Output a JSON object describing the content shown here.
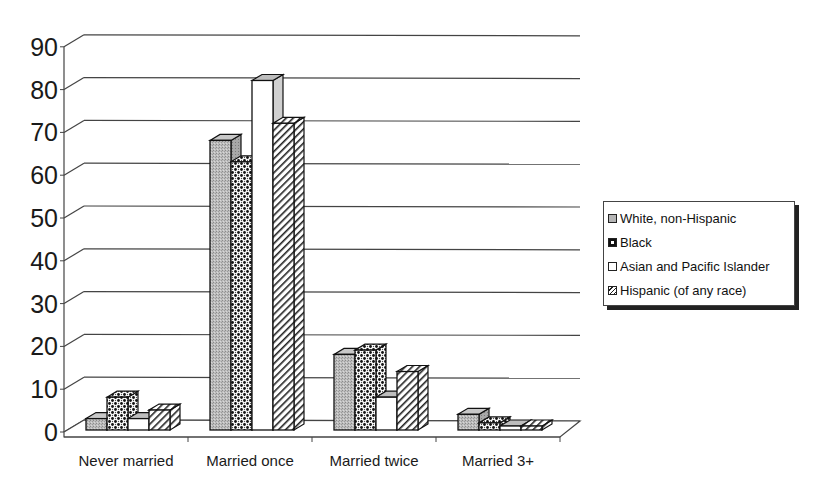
{
  "chart_data": {
    "type": "bar",
    "variant": "3d-clustered-column",
    "title": "",
    "xlabel": "",
    "ylabel": "",
    "categories": [
      "Never married",
      "Married once",
      "Married twice",
      "Married 3+"
    ],
    "series": [
      {
        "name": "White, non-Hispanic",
        "pattern": "gray-stipple",
        "values": [
          5,
          70,
          20,
          6
        ]
      },
      {
        "name": "Black",
        "pattern": "black-dots-checker",
        "values": [
          10,
          65,
          21,
          4
        ]
      },
      {
        "name": "Asian and Pacific Islander",
        "pattern": "white",
        "values": [
          5,
          84,
          10,
          2
        ]
      },
      {
        "name": "Hispanic (of any race)",
        "pattern": "diagonal-hatch",
        "values": [
          7,
          74,
          16,
          3
        ]
      }
    ],
    "yticks": [
      "0",
      "10",
      "20",
      "30",
      "40",
      "50",
      "60",
      "70",
      "80",
      "90"
    ],
    "ylim": [
      0,
      90
    ],
    "grid": true,
    "legend_position": "right"
  },
  "legend": {
    "items": [
      {
        "label": "White, non-Hispanic"
      },
      {
        "label": "Black"
      },
      {
        "label": "Asian and Pacific Islander"
      },
      {
        "label": "Hispanic (of any race)"
      }
    ]
  }
}
